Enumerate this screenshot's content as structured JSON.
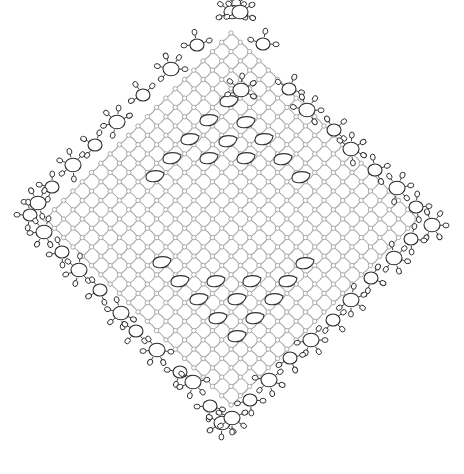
{
  "diagram": {
    "colors": {
      "mesh": "#a8a8a8",
      "motif": "#2a2a2a",
      "background": "#ffffff"
    },
    "shape": {
      "type": "diamond",
      "top": [
        232,
        8
      ],
      "right": [
        440,
        222
      ],
      "bottom": [
        228,
        430
      ],
      "left": [
        22,
        214
      ]
    },
    "mesh": {
      "pitch_x": 18.6,
      "pitch_y": 18.6,
      "picot_radius": 2.2
    },
    "teardrops_upper": [
      [
        229,
        101
      ],
      [
        209,
        120
      ],
      [
        246,
        122
      ],
      [
        190,
        139
      ],
      [
        228,
        141
      ],
      [
        264,
        139
      ],
      [
        172,
        158
      ],
      [
        209,
        158
      ],
      [
        246,
        158
      ],
      [
        283,
        159
      ],
      [
        155,
        176
      ],
      [
        301,
        177
      ]
    ],
    "teardrops_lower": [
      [
        162,
        262
      ],
      [
        305,
        263
      ],
      [
        180,
        281
      ],
      [
        216,
        281
      ],
      [
        252,
        281
      ],
      [
        288,
        281
      ],
      [
        199,
        299
      ],
      [
        237,
        299
      ],
      [
        274,
        299
      ],
      [
        218,
        318
      ],
      [
        255,
        318
      ],
      [
        237,
        336
      ]
    ],
    "edge_rings": {
      "top_left": [
        [
          232,
          12,
          "large"
        ],
        [
          197,
          45,
          "small"
        ],
        [
          171,
          69,
          "large"
        ],
        [
          143,
          95,
          "small"
        ],
        [
          117,
          122,
          "large"
        ],
        [
          95,
          145,
          "small"
        ],
        [
          73,
          165,
          "large"
        ],
        [
          52,
          187,
          "small"
        ],
        [
          38,
          203,
          "large"
        ]
      ],
      "top_right": [
        [
          240,
          12,
          "large"
        ],
        [
          263,
          44,
          "small"
        ],
        [
          241,
          90,
          "large"
        ],
        [
          289,
          89,
          "small"
        ],
        [
          307,
          110,
          "large"
        ],
        [
          334,
          130,
          "small"
        ],
        [
          351,
          149,
          "large"
        ],
        [
          375,
          170,
          "small"
        ],
        [
          397,
          188,
          "large"
        ],
        [
          416,
          207,
          "small"
        ],
        [
          432,
          225,
          "large"
        ]
      ],
      "bottom_left": [
        [
          30,
          215,
          "small"
        ],
        [
          44,
          232,
          "large"
        ],
        [
          62,
          252,
          "small"
        ],
        [
          79,
          270,
          "large"
        ],
        [
          100,
          290,
          "small"
        ],
        [
          121,
          313,
          "large"
        ],
        [
          136,
          331,
          "small"
        ],
        [
          157,
          350,
          "large"
        ],
        [
          180,
          372,
          "small"
        ],
        [
          193,
          382,
          "large"
        ],
        [
          210,
          406,
          "small"
        ],
        [
          222,
          423,
          "large"
        ]
      ],
      "bottom_right": [
        [
          411,
          239,
          "small"
        ],
        [
          394,
          258,
          "large"
        ],
        [
          371,
          278,
          "small"
        ],
        [
          351,
          300,
          "large"
        ],
        [
          333,
          320,
          "small"
        ],
        [
          311,
          340,
          "large"
        ],
        [
          290,
          358,
          "small"
        ],
        [
          269,
          380,
          "large"
        ],
        [
          250,
          400,
          "small"
        ],
        [
          232,
          418,
          "large"
        ]
      ]
    }
  }
}
